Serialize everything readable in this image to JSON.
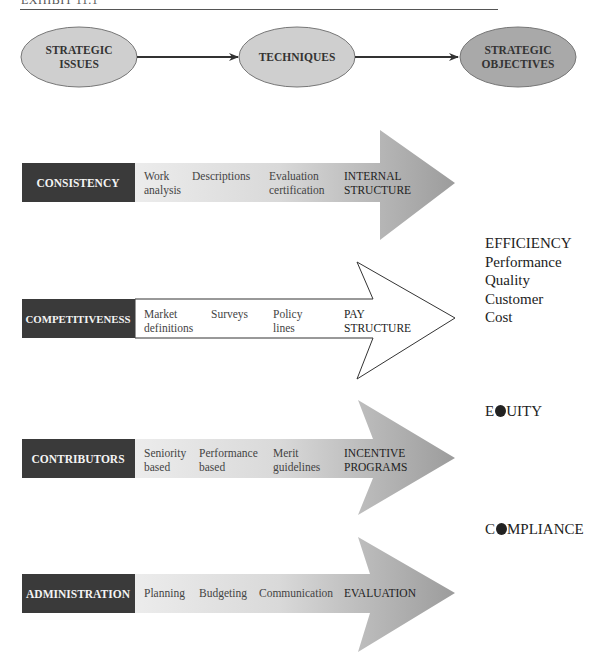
{
  "header": {
    "exhibit_label": "EXHIBIT 11.1"
  },
  "flow": {
    "nodes": [
      {
        "line1": "STRATEGIC",
        "line2": "ISSUES"
      },
      {
        "line1": "TECHNIQUES",
        "line2": ""
      },
      {
        "line1": "STRATEGIC",
        "line2": "OBJECTIVES"
      }
    ]
  },
  "rows": [
    {
      "issue": "CONSISTENCY",
      "style": "gradient",
      "techniques": [
        {
          "line1": "Work",
          "line2": "analysis"
        },
        {
          "line1": "Descriptions",
          "line2": ""
        },
        {
          "line1": "Evaluation",
          "line2": "certification"
        },
        {
          "line1": "INTERNAL",
          "line2": "STRUCTURE"
        }
      ]
    },
    {
      "issue": "COMPETITIVENESS",
      "style": "outline",
      "techniques": [
        {
          "line1": "Market",
          "line2": "definitions"
        },
        {
          "line1": "Surveys",
          "line2": ""
        },
        {
          "line1": "Policy",
          "line2": "lines"
        },
        {
          "line1": "PAY",
          "line2": "STRUCTURE"
        }
      ]
    },
    {
      "issue": "CONTRIBUTORS",
      "style": "gradient",
      "techniques": [
        {
          "line1": "Seniority",
          "line2": "based"
        },
        {
          "line1": "Performance",
          "line2": "based"
        },
        {
          "line1": "Merit",
          "line2": "guidelines"
        },
        {
          "line1": "INCENTIVE",
          "line2": "PROGRAMS"
        }
      ]
    },
    {
      "issue": "ADMINISTRATION",
      "style": "gradient",
      "techniques": [
        {
          "line1": "Planning",
          "line2": ""
        },
        {
          "line1": "Budgeting",
          "line2": ""
        },
        {
          "line1": "Communication",
          "line2": ""
        },
        {
          "line1": "EVALUATION",
          "line2": ""
        }
      ]
    }
  ],
  "objectives": {
    "efficiency": {
      "title": "EFFICIENCY",
      "items": [
        "Performance",
        "Quality",
        "Customer",
        "Cost"
      ]
    },
    "equity": {
      "pre": "E",
      "post": "UITY",
      "full": "EQUITY"
    },
    "compliance": {
      "pre": "C",
      "post": "MPLIANCE",
      "full": "COMPLIANCE"
    }
  },
  "colors": {
    "issue_box": "#3a3a3a",
    "ellipse_light": "#cfcfcf",
    "ellipse_dark": "#a9a9a9",
    "arrow_light": "#e6e6e6",
    "arrow_dark": "#9a9a9a"
  }
}
